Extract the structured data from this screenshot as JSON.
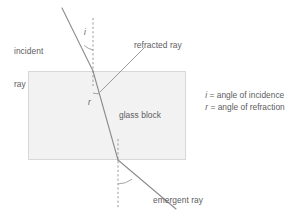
{
  "figure": {
    "background_color": "#ffffff",
    "ray_color": "#8c8c8e",
    "normal_color": "#9a9a9c",
    "block_fill": "#f2f2f2",
    "block_stroke": "#d8d8d8",
    "text_color": "#5c5c5e"
  },
  "labels": {
    "incident_ray_line1": "incident",
    "incident_ray_line2": "ray",
    "refracted_ray": "refracted ray",
    "glass_block": "glass block",
    "emergent_ray": "emergent ray",
    "angle_i": "i",
    "angle_r": "r"
  },
  "legend": {
    "items": [
      {
        "symbol": "i",
        "equals": " = ",
        "text": "angle of incidence"
      },
      {
        "symbol": "r",
        "equals": " = ",
        "text": "angle of refraction"
      }
    ]
  },
  "geometry": {
    "block": {
      "x": 28,
      "y": 71,
      "width": 158,
      "height": 89
    },
    "entry_point": {
      "x": 93,
      "y": 71
    },
    "exit_point": {
      "x": 118,
      "y": 160
    },
    "incident_start": {
      "x": 62,
      "y": 8
    },
    "emergent_end": {
      "x": 176,
      "y": 209
    },
    "normal_top": {
      "x": 93,
      "y1": 18,
      "y2": 86
    },
    "normal_bottom": {
      "x": 118,
      "y1": 139,
      "y2": 209
    },
    "pointer_line": {
      "x1": 100,
      "y1": 92,
      "x2": 144,
      "y2": 48
    }
  }
}
